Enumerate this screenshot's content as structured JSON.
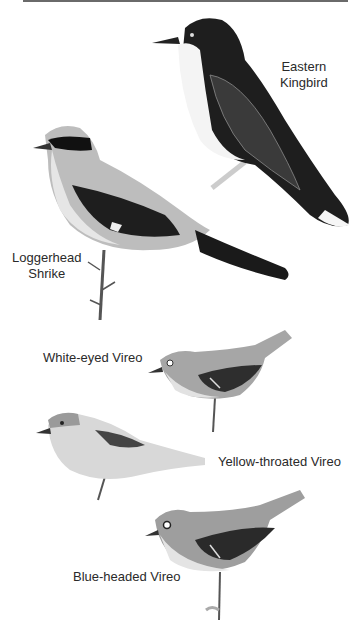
{
  "plate": {
    "birds": [
      {
        "name": "Eastern Kingbird",
        "line1": "Eastern",
        "line2": "Kingbird"
      },
      {
        "name": "Loggerhead Shrike",
        "line1": "Loggerhead",
        "line2": "Shrike"
      },
      {
        "name": "White-eyed Vireo",
        "line1": "White-eyed Vireo"
      },
      {
        "name": "Yellow-throated Vireo",
        "line1": "Yellow-throated Vireo"
      },
      {
        "name": "Blue-headed Vireo",
        "line1": "Blue-headed Vireo"
      }
    ]
  }
}
